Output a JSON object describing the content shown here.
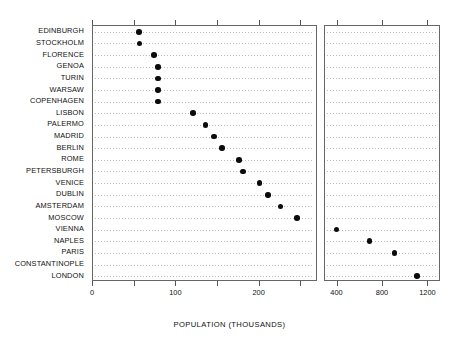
{
  "chart_data": {
    "type": "scatter",
    "title": "",
    "subtitle": "",
    "xlabel": "POPULATION (THOUSANDS)",
    "ylabel": "",
    "grid": true,
    "legend": null,
    "orientation": "horizontal-dotplot",
    "note": "Cleveland dot plot with a broken (two-panel) x axis; left panel 0-270, right panel 300-1300",
    "categories": [
      "EDINBURGH",
      "STOCKHOLM",
      "FLORENCE",
      "GENOA",
      "TURIN",
      "WARSAW",
      "COPENHAGEN",
      "LISBON",
      "PALERMO",
      "MADRID",
      "BERLIN",
      "ROME",
      "PETERSBURGH",
      "VENICE",
      "DUBLIN",
      "AMSTERDAM",
      "MOSCOW",
      "VIENNA",
      "NAPLES",
      "PARIS",
      "CONSTANTINOPLE",
      "LONDON"
    ],
    "values": [
      55,
      56,
      73,
      78,
      78,
      78,
      78,
      120,
      135,
      145,
      155,
      175,
      180,
      200,
      210,
      225,
      245,
      390,
      680,
      900,
      null,
      1100
    ],
    "points": [
      {
        "label": "EDINBURGH",
        "value": 55,
        "panel": "left"
      },
      {
        "label": "STOCKHOLM",
        "value": 56,
        "panel": "left"
      },
      {
        "label": "FLORENCE",
        "value": 73,
        "panel": "left"
      },
      {
        "label": "GENOA",
        "value": 78,
        "panel": "left"
      },
      {
        "label": "TURIN",
        "value": 78,
        "panel": "left"
      },
      {
        "label": "WARSAW",
        "value": 78,
        "panel": "left"
      },
      {
        "label": "COPENHAGEN",
        "value": 78,
        "panel": "left"
      },
      {
        "label": "LISBON",
        "value": 120,
        "panel": "left"
      },
      {
        "label": "PALERMO",
        "value": 135,
        "panel": "left"
      },
      {
        "label": "MADRID",
        "value": 145,
        "panel": "left"
      },
      {
        "label": "BERLIN",
        "value": 155,
        "panel": "left"
      },
      {
        "label": "ROME",
        "value": 175,
        "panel": "left"
      },
      {
        "label": "PETERSBURGH",
        "value": 180,
        "panel": "left"
      },
      {
        "label": "VENICE",
        "value": 200,
        "panel": "left"
      },
      {
        "label": "DUBLIN",
        "value": 210,
        "panel": "left"
      },
      {
        "label": "AMSTERDAM",
        "value": 225,
        "panel": "left"
      },
      {
        "label": "MOSCOW",
        "value": 245,
        "panel": "left"
      },
      {
        "label": "VIENNA",
        "value": 390,
        "panel": "right"
      },
      {
        "label": "NAPLES",
        "value": 680,
        "panel": "right"
      },
      {
        "label": "PARIS",
        "value": 900,
        "panel": "right"
      },
      {
        "label": "CONSTANTINOPLE",
        "value": null,
        "panel": "none"
      },
      {
        "label": "LONDON",
        "value": 1100,
        "panel": "right"
      }
    ],
    "panels": [
      {
        "name": "left",
        "xlim": [
          0,
          270
        ],
        "ticks": [
          0,
          50,
          100,
          150,
          200,
          250
        ],
        "tick_labels": [
          "0",
          "",
          "100",
          "",
          "200",
          ""
        ]
      },
      {
        "name": "right",
        "xlim": [
          290,
          1310
        ],
        "ticks": [
          400,
          800,
          1200
        ],
        "tick_labels": [
          "400",
          "800",
          "1200"
        ]
      }
    ]
  }
}
